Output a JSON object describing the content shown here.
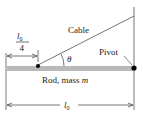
{
  "labels": {
    "cable": "Cable",
    "pivot": "Pivot",
    "rod": "Rod, mass ",
    "rod_mass_symbol": "m",
    "theta": "θ",
    "length_symbol": "l",
    "length_subscript": "0",
    "fraction_denominator": "4"
  },
  "colors": {
    "rod": "#b9b9b9",
    "line": "#555555",
    "dot": "#000000",
    "text": "#222222"
  }
}
